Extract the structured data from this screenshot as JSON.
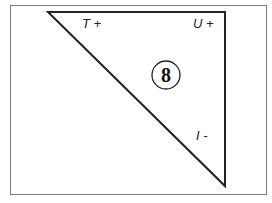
{
  "diagram": {
    "frame": {
      "x": 10,
      "y": 5,
      "width": 257,
      "height": 190,
      "stroke": "#777777"
    },
    "triangle": {
      "points": "48,12 225,12 225,186",
      "stroke": "#222222"
    },
    "labels": {
      "top_left": "T +",
      "top_right": "U +",
      "right": "I -"
    },
    "badge": {
      "number": "8",
      "cx": 166,
      "cy": 75,
      "r": 14
    }
  }
}
